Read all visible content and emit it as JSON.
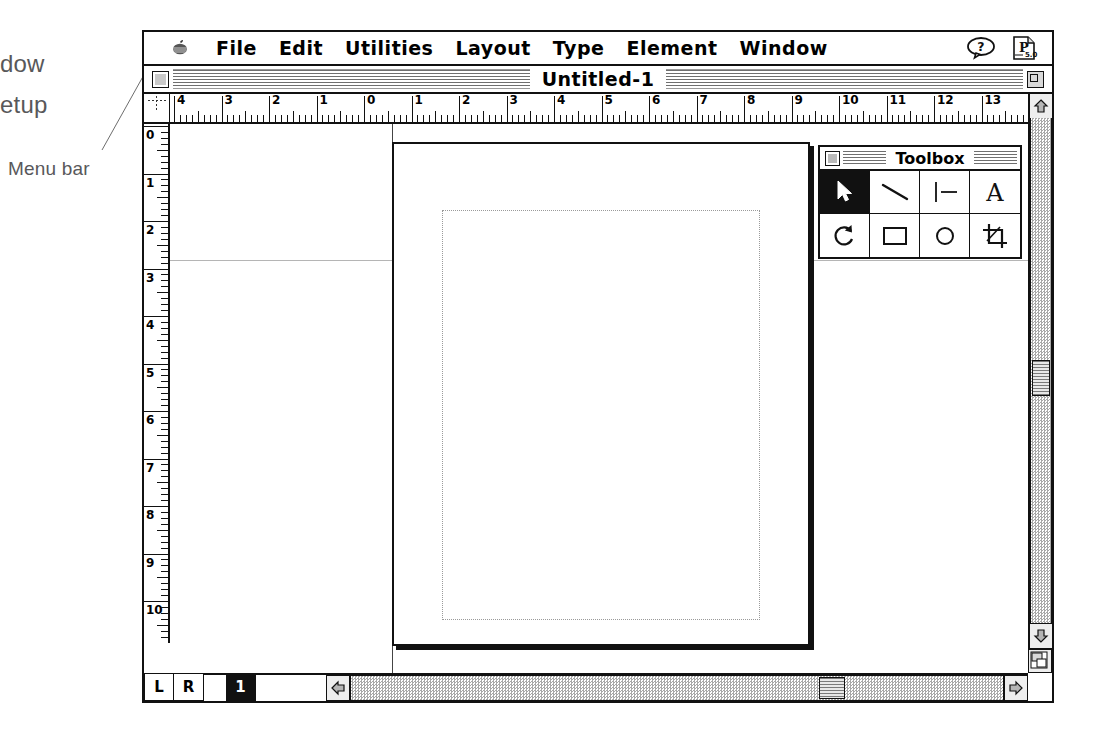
{
  "annotations": [
    {
      "id": "window-cut",
      "label": "dow",
      "x": 0,
      "y": 50
    },
    {
      "id": "setup-cut",
      "label": "etup",
      "x": 0,
      "y": 91
    },
    {
      "id": "menu-bar",
      "label": "Menu bar",
      "x": 8,
      "y": 158
    },
    {
      "id": "rulers",
      "label": "Rulers",
      "x": 268,
      "y": 183
    },
    {
      "id": "title-bar",
      "label": "Title bar",
      "x": 556,
      "y": 180
    },
    {
      "id": "top-margin",
      "label": "Top margin at 2\"",
      "x": 228,
      "y": 293
    },
    {
      "id": "margin-guides",
      "label": "Margin guides",
      "x": 508,
      "y": 362
    },
    {
      "id": "toolbox",
      "label": "Toolbox",
      "x": 906,
      "y": 298
    },
    {
      "id": "page-setup",
      "label": "Page setup",
      "x": 904,
      "y": 436
    },
    {
      "id": "pasteboard",
      "label": "Pasteboard",
      "x": 248,
      "y": 527
    },
    {
      "id": "scroll-bars",
      "label": "Scroll bars",
      "x": 848,
      "y": 562
    }
  ],
  "menubar": {
    "apple_icon": "apple-icon",
    "items": [
      "File",
      "Edit",
      "Utilities",
      "Layout",
      "Type",
      "Element",
      "Window"
    ],
    "help_icon": "help-balloon-icon",
    "app_icon": "pagemaker-5-icon"
  },
  "titlebar": {
    "title": "Untitled-1",
    "close_icon": "close-box-icon",
    "zoom_icon": "zoom-box-icon"
  },
  "rulers": {
    "unit": "inches",
    "horizontal_labels": [
      "4",
      "3",
      "2",
      "1",
      "0",
      "1",
      "2",
      "3",
      "4",
      "5",
      "6",
      "7",
      "8",
      "9",
      "10",
      "11",
      "12",
      "13"
    ],
    "vertical_labels": [
      "0",
      "1",
      "2",
      "3",
      "4",
      "5",
      "6",
      "7",
      "8",
      "9",
      "10",
      "11"
    ]
  },
  "toolbox": {
    "title": "Toolbox",
    "close_icon": "close-box-icon",
    "tools": [
      {
        "name": "pointer-tool",
        "icon": "arrow-pointer-icon",
        "selected": true
      },
      {
        "name": "line-tool",
        "icon": "diagonal-line-icon",
        "selected": false
      },
      {
        "name": "constrained-line-tool",
        "icon": "perpendicular-line-icon",
        "selected": false
      },
      {
        "name": "text-tool",
        "icon": "letter-a-icon",
        "selected": false
      },
      {
        "name": "rotate-tool",
        "icon": "rotate-arrow-icon",
        "selected": false
      },
      {
        "name": "rectangle-tool",
        "icon": "rectangle-icon",
        "selected": false
      },
      {
        "name": "ellipse-tool",
        "icon": "ellipse-icon",
        "selected": false
      },
      {
        "name": "cropping-tool",
        "icon": "crop-icon",
        "selected": false
      }
    ]
  },
  "statusbar": {
    "master_pages": [
      "L",
      "R"
    ],
    "pages": [
      {
        "label": "1",
        "selected": true
      }
    ]
  },
  "scrollbars": {
    "up_icon": "arrow-up-icon",
    "down_icon": "arrow-down-icon",
    "left_icon": "arrow-left-icon",
    "right_icon": "arrow-right-icon",
    "grow_icon": "resize-grip-icon"
  },
  "colors": {
    "ink": "#111111",
    "annotation_text": "#58585a",
    "guide": "#9a9a9a",
    "scroll_track": "#a8a8a8"
  }
}
